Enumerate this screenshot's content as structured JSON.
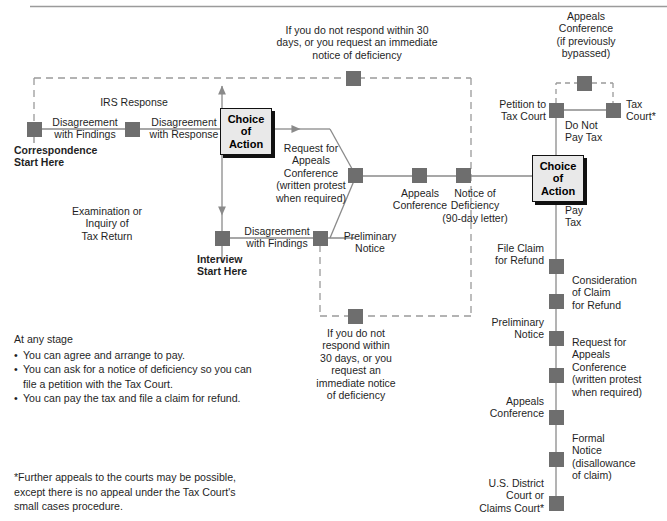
{
  "diagram": {
    "colors": {
      "node": "#6e6e6e",
      "box_fill": "#e9e9e9",
      "box_border": "#111111",
      "line": "#8a8a8a",
      "dashed": "#9a9a9a",
      "text": "#1f1f1f"
    }
  },
  "boxes": {
    "choice_left": "Choice\nof\nAction",
    "choice_right": "Choice\nof\nAction"
  },
  "labels": {
    "correspondence_start": "Correspondence\nStart Here",
    "interview_start": "Interview\nStart Here",
    "disagreement_findings_top": "Disagreement\nwith Findings",
    "irs_response": "IRS Response",
    "disagreement_response": "Disagreement\nwith Response",
    "examination_inquiry": "Examination or\nInquiry of\nTax Return",
    "disagreement_findings_bottom": "Disagreement\nwith Findings",
    "request_appeals_left": "Request for\nAppeals\nConference\n(written protest\nwhen required)",
    "preliminary_notice_center": "Preliminary\nNotice",
    "appeals_conference_center": "Appeals\nConference",
    "notice_of_deficiency": "Notice of\nDeficiency\n(90-day letter)",
    "top_dashed_text": "If you do not respond within 30\ndays, or you request an immediate\nnotice of deficiency",
    "bottom_dashed_text": "If you do not\nrespond within\n30 days, or you\nrequest an\nimmediate notice\nof deficiency",
    "appeals_conference_bypassed": "Appeals\nConference\n(if previously\nbypassed)",
    "petition_to_tax_court": "Petition to\nTax Court",
    "tax_court": "Tax\nCourt*",
    "do_not_pay_tax": "Do Not\nPay Tax",
    "pay_tax": "Pay\nTax",
    "file_claim_for_refund": "File Claim\nfor Refund",
    "consideration_of_claim": "Consideration\nof Claim\nfor Refund",
    "preliminary_notice_right": "Preliminary\nNotice",
    "request_appeals_right": "Request for\nAppeals\nConference\n(written protest\nwhen required)",
    "appeals_conference_right": "Appeals\nConference",
    "formal_notice": "Formal\nNotice\n(disallowance\nof claim)",
    "district_court": "U.S. District\nCourt or\nClaims Court*"
  },
  "notes": {
    "heading": "At any stage",
    "items": [
      "You can agree and arrange to pay.",
      "You can ask for a notice of deficiency so you can\nfile a petition with the Tax Court.",
      "You can pay the tax and file a claim for refund."
    ]
  },
  "footnote": "*Further appeals to the courts may be possible,\nexcept there is no appeal under the Tax Court's\nsmall cases procedure."
}
